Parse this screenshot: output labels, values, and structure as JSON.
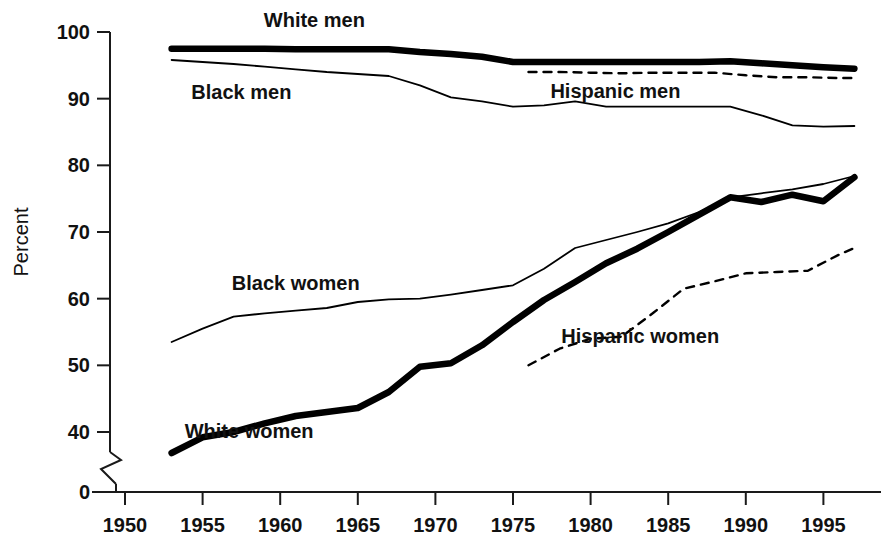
{
  "chart_data": {
    "type": "line",
    "title": "",
    "xlabel": "",
    "ylabel": "Percent",
    "xlim": [
      1948,
      1998
    ],
    "ylim": [
      0,
      100
    ],
    "y_axis_break": true,
    "y_break_between": [
      0,
      40
    ],
    "grid": false,
    "legend": "inline-labels",
    "xticks": [
      1950,
      1955,
      1960,
      1965,
      1970,
      1975,
      1980,
      1985,
      1990,
      1995
    ],
    "xtick_labels": [
      "1950",
      "1955",
      "1960",
      "1965",
      "1970",
      "1975",
      "1980",
      "1985",
      "1990",
      "1995"
    ],
    "yticks": [
      0,
      40,
      50,
      60,
      70,
      80,
      90,
      100
    ],
    "ytick_labels": [
      "0",
      "40",
      "50",
      "60",
      "70",
      "80",
      "90",
      "100"
    ],
    "series": [
      {
        "name": "White men",
        "style": "thick-solid",
        "label": "White men",
        "label_x": 1962.2,
        "label_y": 101.8,
        "x": [
          1953,
          1955,
          1957,
          1959,
          1961,
          1963,
          1965,
          1967,
          1969,
          1971,
          1973,
          1975,
          1977,
          1979,
          1981,
          1983,
          1985,
          1987,
          1989,
          1991,
          1993,
          1995,
          1997
        ],
        "values": [
          97.5,
          97.5,
          97.5,
          97.5,
          97.4,
          97.4,
          97.4,
          97.4,
          97.0,
          96.7,
          96.3,
          95.5,
          95.5,
          95.5,
          95.5,
          95.5,
          95.5,
          95.5,
          95.6,
          95.3,
          95.0,
          94.7,
          94.5
        ]
      },
      {
        "name": "Black men",
        "style": "thin-solid",
        "label": "Black men",
        "label_x": 1957.5,
        "label_y": 91.0,
        "x": [
          1953,
          1955,
          1957,
          1959,
          1961,
          1963,
          1965,
          1967,
          1969,
          1971,
          1973,
          1975,
          1977,
          1979,
          1981,
          1983,
          1985,
          1987,
          1989,
          1991,
          1993,
          1995,
          1997
        ],
        "values": [
          95.8,
          95.5,
          95.2,
          94.8,
          94.4,
          94.0,
          93.7,
          93.4,
          92.0,
          90.2,
          89.6,
          88.8,
          89.0,
          89.6,
          88.8,
          88.8,
          88.8,
          88.8,
          88.8,
          87.5,
          86.0,
          85.8,
          85.9
        ]
      },
      {
        "name": "Hispanic men",
        "style": "dashed",
        "label": "Hispanic men",
        "label_x": 1981.6,
        "label_y": 91.2,
        "x": [
          1976,
          1978,
          1980,
          1982,
          1984,
          1986,
          1988,
          1990,
          1992,
          1994,
          1996,
          1997
        ],
        "values": [
          94.0,
          94.0,
          93.9,
          93.8,
          93.9,
          93.9,
          93.9,
          93.5,
          93.2,
          93.2,
          93.1,
          93.1
        ]
      },
      {
        "name": "Black women",
        "style": "thin-solid",
        "label": "Black women",
        "label_x": 1961.0,
        "label_y": 62.4,
        "x": [
          1953,
          1955,
          1957,
          1959,
          1961,
          1963,
          1965,
          1967,
          1969,
          1971,
          1973,
          1975,
          1977,
          1979,
          1981,
          1983,
          1985,
          1987,
          1989,
          1991,
          1993,
          1995,
          1997
        ],
        "values": [
          53.5,
          55.5,
          57.3,
          57.8,
          58.2,
          58.6,
          59.5,
          59.9,
          60.0,
          60.6,
          61.3,
          62.0,
          64.5,
          67.6,
          68.8,
          70.0,
          71.3,
          73.0,
          75.2,
          75.8,
          76.4,
          77.2,
          78.4
        ]
      },
      {
        "name": "White women",
        "style": "thick-solid",
        "label": "White women",
        "label_x": 1958.0,
        "label_y": 40.2,
        "x": [
          1953,
          1955,
          1957,
          1959,
          1961,
          1963,
          1965,
          1967,
          1969,
          1971,
          1973,
          1975,
          1977,
          1979,
          1981,
          1983,
          1985,
          1987,
          1989,
          1991,
          1993,
          1995,
          1997
        ],
        "values": [
          26.0,
          36.5,
          40.0,
          41.3,
          42.4,
          43.0,
          43.6,
          46.0,
          49.8,
          50.3,
          53.0,
          56.5,
          59.8,
          62.5,
          65.3,
          67.5,
          70.0,
          72.6,
          75.2,
          74.5,
          75.6,
          74.6,
          78.2
        ]
      },
      {
        "name": "Hispanic women",
        "style": "dashed",
        "label": "Hispanic women",
        "label_x": 1983.2,
        "label_y": 54.4,
        "x": [
          1976,
          1978,
          1980,
          1982,
          1984,
          1986,
          1988,
          1990,
          1992,
          1994,
          1996,
          1997
        ],
        "values": [
          50.0,
          52.5,
          54.0,
          54.3,
          57.8,
          61.5,
          62.6,
          63.8,
          64.0,
          64.2,
          66.6,
          67.6
        ]
      }
    ]
  },
  "axes": {
    "y_title": "Percent"
  },
  "colors": {
    "ink": "#000000",
    "background": "#ffffff",
    "axis": "#1a1a1a"
  }
}
